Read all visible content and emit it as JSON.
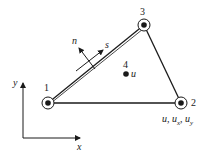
{
  "diagram": {
    "type": "triangular finite element",
    "nodes": [
      {
        "id": "1",
        "label": "1",
        "x": 48,
        "y": 103
      },
      {
        "id": "2",
        "label": "2",
        "x": 181,
        "y": 103
      },
      {
        "id": "3",
        "label": "3",
        "x": 144,
        "y": 25
      },
      {
        "id": "4",
        "label": "4",
        "x": 126,
        "y": 74,
        "sublabel": "u"
      }
    ],
    "edges": [
      [
        "1",
        "2"
      ],
      [
        "2",
        "3"
      ],
      [
        "3",
        "1"
      ]
    ],
    "node2_dofs": {
      "u": "u,",
      "ux": "u",
      "ux_sub": "x",
      "sep": ",",
      "uy": "u",
      "uy_sub": "y"
    },
    "normal_label": "n",
    "tangent_label": "s",
    "axes": {
      "x_label": "x",
      "y_label": "y"
    },
    "colors": {
      "line": "#1a1a1a",
      "background": "#ffffff"
    }
  }
}
